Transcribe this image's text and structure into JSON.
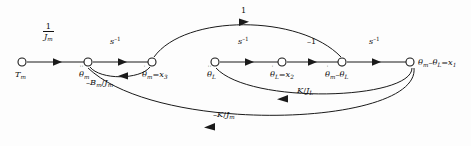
{
  "diagram": {
    "type": "signal-flow-graph",
    "background_color": "#fdfdfd",
    "line_color": "#1a1a1a",
    "width": 471,
    "height": 146,
    "nodes": [
      {
        "id": "n1",
        "label": "T_m",
        "x": 22,
        "y": 62,
        "label_dx": -6,
        "label_dy": 9,
        "dots": 0
      },
      {
        "id": "n2",
        "label": "theta_m_ddot",
        "x": 88,
        "y": 62,
        "label_dx": -9,
        "label_dy": 9,
        "dots": 2
      },
      {
        "id": "n3",
        "label": "theta_m_dot_x3",
        "x": 152,
        "y": 62,
        "label_dx": -8,
        "label_dy": 9,
        "dots": 1
      },
      {
        "id": "n4",
        "label": "theta_L_ddot",
        "x": 215,
        "y": 62,
        "label_dx": -8,
        "label_dy": 9,
        "dots": 2
      },
      {
        "id": "n5",
        "label": "theta_L_dot_x2",
        "x": 282,
        "y": 62,
        "label_dx": -12,
        "label_dy": 9,
        "dots": 1
      },
      {
        "id": "n6",
        "label": "theta_diff_dot",
        "x": 342,
        "y": 62,
        "label_dx": -17,
        "label_dy": 9,
        "dots": 1
      },
      {
        "id": "n7",
        "label": "theta_diff_x1",
        "x": 410,
        "y": 62,
        "label_dx": 6,
        "label_dy": 3,
        "dots": 0
      }
    ],
    "node_labels": {
      "n1": "T",
      "n1_sub": "m",
      "n2_main": "θ",
      "n2_sub": "m",
      "n3_main": "θ",
      "n3_sub": "m",
      "n3_eq": "=x",
      "n3_eqsub": "3",
      "n4_main": "θ",
      "n4_sub": "L",
      "n5_main": "θ",
      "n5_sub": "L",
      "n5_eq": "=x",
      "n5_eqsub": "2",
      "n6_a": "θ",
      "n6_asub": "m",
      "n6_minus": "–",
      "n6_b": "θ",
      "n6_bsub": "L",
      "n7_a": "θ",
      "n7_asub": "m",
      "n7_minus": "–",
      "n7_b": "θ",
      "n7_bsub": "L",
      "n7_eq": "=x",
      "n7_eqsub": "1"
    },
    "branches": [
      {
        "id": "b1",
        "from": "n1",
        "to": "n2",
        "gain": "1/J_m",
        "label_x": 47,
        "label_y": 26,
        "kind": "fraction",
        "num": "1",
        "den_main": "J",
        "den_sub": "m"
      },
      {
        "id": "b2",
        "from": "n2",
        "to": "n3",
        "gain": "s^-1",
        "label_x": 113,
        "label_y": 40,
        "kind": "power",
        "base": "s",
        "exp": "–1"
      },
      {
        "id": "b3",
        "from": "n4",
        "to": "n5",
        "gain": "s^-1",
        "label_x": 240,
        "label_y": 40,
        "kind": "power",
        "base": "s",
        "exp": "–1"
      },
      {
        "id": "b4",
        "from": "n5",
        "to": "n6",
        "gain": "-1",
        "label_x": 309,
        "label_y": 40,
        "kind": "plain",
        "text": "–1"
      },
      {
        "id": "b5",
        "from": "n6",
        "to": "n7",
        "gain": "s^-1",
        "label_x": 371,
        "label_y": 40,
        "kind": "power",
        "base": "s",
        "exp": "–1"
      },
      {
        "id": "b6",
        "from": "n3",
        "to": "n6",
        "gain": "1",
        "label_x": 243,
        "label_y": 9,
        "kind": "plain",
        "text": "1"
      },
      {
        "id": "b7",
        "from": "n3",
        "to": "n2",
        "gain": "-B_m/J_m",
        "label_x": 103,
        "label_y": 79,
        "kind": "ratio",
        "lead": "–B",
        "lead_sub": "m",
        "slash": "/",
        "trail": "J",
        "trail_sub": "m"
      },
      {
        "id": "b8",
        "from": "n7",
        "to": "n4",
        "gain": "K/J_L",
        "label_x": 299,
        "label_y": 93,
        "kind": "ratio",
        "lead": "K",
        "lead_sub": "",
        "slash": "/",
        "trail": "J",
        "trail_sub": "L"
      },
      {
        "id": "b9",
        "from": "n7",
        "to": "n2",
        "gain": "-K/J_m",
        "label_x": 217,
        "label_y": 116,
        "kind": "ratio",
        "lead": "–K",
        "lead_sub": "",
        "slash": "/",
        "trail": "J",
        "trail_sub": "m"
      }
    ]
  }
}
